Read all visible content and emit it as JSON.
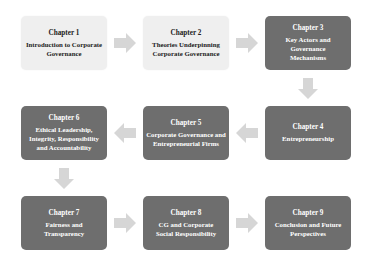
{
  "diagram": {
    "type": "flowchart",
    "colors": {
      "light_box": "#efefef",
      "dark_box": "#6e6e6e",
      "arrow": "#d6d6d6",
      "light_text": "#222222",
      "dark_text": "#ffffff"
    },
    "chapters": [
      {
        "chapter": "Chapter 1",
        "title": "Introduction to Corporate Governance",
        "style": "light"
      },
      {
        "chapter": "Chapter 2",
        "title": "Theories Underpinning Corporate Governance",
        "style": "light"
      },
      {
        "chapter": "Chapter 3",
        "title": "Key Actors and Governance Mechanisms",
        "style": "dark"
      },
      {
        "chapter": "Chapter 4",
        "title": "Entrepreneurship",
        "style": "dark"
      },
      {
        "chapter": "Chapter 5",
        "title": "Corporate Governance and Entrepreneurial Firms",
        "style": "dark"
      },
      {
        "chapter": "Chapter 6",
        "title": "Ethical Leadership, Integrity, Responsibility and Accountability",
        "style": "dark"
      },
      {
        "chapter": "Chapter 7",
        "title": "Fairness and Transparency",
        "style": "dark"
      },
      {
        "chapter": "Chapter 8",
        "title": "CG and Corporate Social Responsibility",
        "style": "dark"
      },
      {
        "chapter": "Chapter 9",
        "title": "Conclusion and Future Perspectives",
        "style": "dark"
      }
    ],
    "flow": [
      {
        "from": "Chapter 1",
        "to": "Chapter 2",
        "direction": "right"
      },
      {
        "from": "Chapter 2",
        "to": "Chapter 3",
        "direction": "right"
      },
      {
        "from": "Chapter 3",
        "to": "Chapter 4",
        "direction": "down"
      },
      {
        "from": "Chapter 4",
        "to": "Chapter 5",
        "direction": "left"
      },
      {
        "from": "Chapter 5",
        "to": "Chapter 6",
        "direction": "left"
      },
      {
        "from": "Chapter 6",
        "to": "Chapter 7",
        "direction": "down"
      },
      {
        "from": "Chapter 7",
        "to": "Chapter 8",
        "direction": "right"
      },
      {
        "from": "Chapter 8",
        "to": "Chapter 9",
        "direction": "right"
      }
    ]
  }
}
